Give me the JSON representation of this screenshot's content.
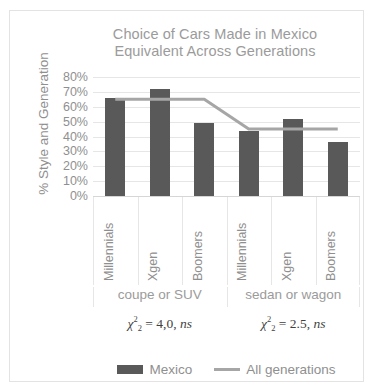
{
  "chart_data": {
    "type": "bar",
    "title": "Choice of Cars Made in Mexico Equivalent Across Generations",
    "title_lines": [
      "Choice of Cars Made in Mexico",
      "Equivalent Across Generations"
    ],
    "xlabel": "",
    "ylabel": "% Style and Generation",
    "ylim": [
      0,
      80
    ],
    "ytick_labels": [
      "80%",
      "70%",
      "60%",
      "50%",
      "40%",
      "30%",
      "20%",
      "10%",
      "0%"
    ],
    "ytick_values": [
      80,
      70,
      60,
      50,
      40,
      30,
      20,
      10,
      0
    ],
    "grid": true,
    "legend_position": "bottom",
    "categories": [
      "Millennials",
      "Xgen",
      "Boomers",
      "Millennials",
      "Xgen",
      "Boomers"
    ],
    "groups": [
      {
        "label": "coupe or SUV",
        "categories": [
          "Millennials",
          "Xgen",
          "Boomers"
        ]
      },
      {
        "label": "sedan or wagon",
        "categories": [
          "Millennials",
          "Xgen",
          "Boomers"
        ]
      }
    ],
    "series": [
      {
        "name": "Mexico",
        "type": "bar",
        "color": "#595959",
        "values": [
          66,
          72,
          49,
          44,
          52,
          36
        ]
      },
      {
        "name": "All generations",
        "type": "line",
        "color": "#a6a6a6",
        "values": [
          65,
          65,
          65,
          45,
          45,
          45
        ]
      }
    ],
    "annotations": [
      {
        "group": "coupe or SUV",
        "text": "χ²₂ = 4,0, ns",
        "symbol": "χ",
        "superscript": "2",
        "subscript": "2",
        "value": "4,0",
        "significance": "ns"
      },
      {
        "group": "sedan or wagon",
        "text": "χ²₂ = 2.5, ns",
        "symbol": "χ",
        "superscript": "2",
        "subscript": "2",
        "value": "2.5",
        "significance": "ns"
      }
    ]
  },
  "legend": {
    "entries": [
      {
        "label": "Mexico",
        "marker": "bar-swatch",
        "color": "#595959"
      },
      {
        "label": "All generations",
        "marker": "line-swatch",
        "color": "#a6a6a6"
      }
    ]
  },
  "colors": {
    "bar": "#595959",
    "line": "#a6a6a6",
    "grid": "#e6e6e6",
    "text": "#8f8f8f",
    "title": "#9b9b9b",
    "frame": "#e3e3e3"
  }
}
